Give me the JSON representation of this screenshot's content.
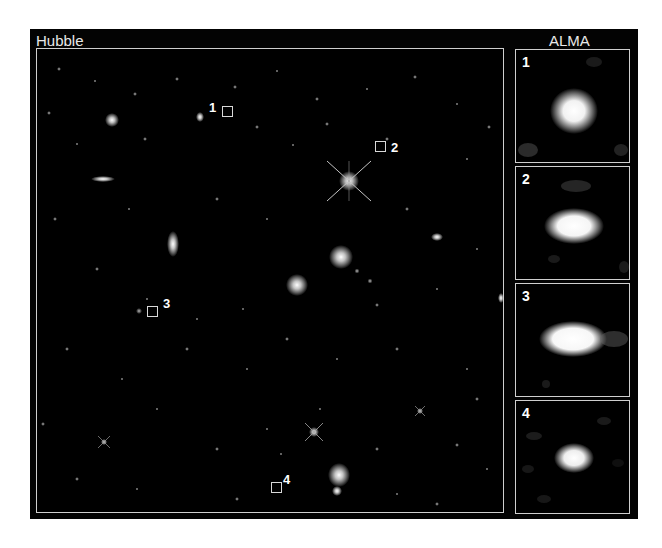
{
  "figure": {
    "left_title": "Hubble",
    "right_title": "ALMA",
    "background_color": "#000000",
    "frame_color": "#cfcfcf"
  },
  "hubble_markers": [
    {
      "label": "1",
      "x": 228,
      "y": 111
    },
    {
      "label": "2",
      "x": 381,
      "y": 147
    },
    {
      "label": "3",
      "x": 152,
      "y": 311
    },
    {
      "label": "4",
      "x": 277,
      "y": 487
    }
  ],
  "alma_panels": [
    {
      "label": "1",
      "source": "Galaxy 1"
    },
    {
      "label": "2",
      "source": "Galaxy 2"
    },
    {
      "label": "3",
      "source": "Galaxy 3"
    },
    {
      "label": "4",
      "source": "Galaxy 4"
    }
  ]
}
